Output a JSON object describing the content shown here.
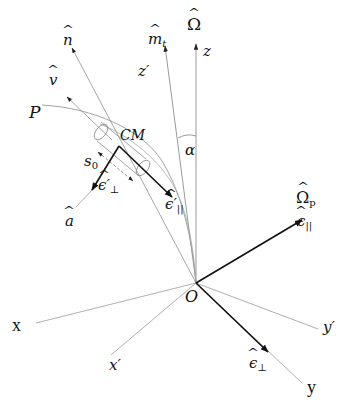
{
  "diagram": {
    "type": "vector-geometry",
    "colors": {
      "thin_line": "#9a9a9a",
      "thick_line": "#111111",
      "text": "#111111",
      "background": "#ffffff"
    },
    "labels": {
      "omega": "Ω",
      "z": "z",
      "m_t": "m",
      "m_t_sub": "t",
      "z_prime": "z′",
      "n": "n",
      "v": "v",
      "P": "P",
      "CM": "CM",
      "s0": "s",
      "s0_sub": "0",
      "eps_perp_prime": "ϵ′",
      "eps_perp_prime_sub": "⊥",
      "eps_par_prime": "ϵ′",
      "eps_par_prime_sub": "||",
      "a": "a",
      "alpha": "α",
      "omega_p": "Ω",
      "omega_p_sub": "p",
      "eps_par": "ϵ",
      "eps_par_sub": "||",
      "O": "O",
      "eps_perp": "ϵ",
      "eps_perp_sub": "⊥",
      "x": "x",
      "x_prime": "x′",
      "y": "y",
      "y_prime": "y′"
    },
    "nodes": [
      {
        "id": "O",
        "label": "O",
        "x": 196,
        "y": 283
      },
      {
        "id": "CM",
        "label": "CM",
        "x": 120,
        "y": 146
      }
    ],
    "edges": [
      {
        "from": "O",
        "to": "z-axis",
        "label": "Ω̂ / z",
        "style": "thin-arrow"
      },
      {
        "from": "O",
        "to": "m_t-axis",
        "label": "m̂_t / z′",
        "style": "thin-arrow"
      },
      {
        "from": "O",
        "to": "x",
        "style": "thin"
      },
      {
        "from": "O",
        "to": "x′",
        "style": "thin"
      },
      {
        "from": "O",
        "to": "y′",
        "style": "thin"
      },
      {
        "from": "O",
        "to": "y",
        "style": "thin"
      },
      {
        "from": "O",
        "to": "Ω̂_p",
        "label": "ϵ̂_||",
        "style": "thick-arrow"
      },
      {
        "from": "O",
        "to": "ϵ̂_⊥",
        "style": "thick-arrow"
      },
      {
        "from": "CM",
        "to": "ϵ̂′_||",
        "style": "thick-arrow"
      },
      {
        "from": "CM",
        "to": "ϵ̂′_⊥",
        "style": "thick-arrow"
      },
      {
        "from": "CM",
        "to": "n̂",
        "style": "thin-arrow"
      },
      {
        "from": "CM",
        "to": "v̂",
        "style": "thin-arrow"
      },
      {
        "from": "P",
        "to": "O",
        "label": "field line P",
        "style": "thin-curve"
      }
    ]
  }
}
